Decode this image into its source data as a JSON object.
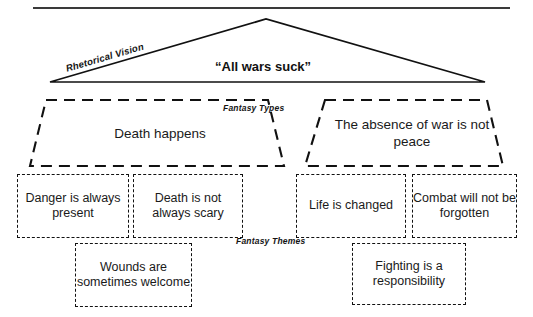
{
  "diagram": {
    "title_rule": "horizontal-rule",
    "rhetorical_vision_label": "Rhetorical Vision",
    "vision_statement": "“All wars suck”",
    "fantasy_types_label": "Fantasy Types",
    "fantasy_themes_label": "Fantasy Themes",
    "fantasy_types": [
      {
        "id": "left",
        "text": "Death happens"
      },
      {
        "id": "right",
        "text": "The absence of war is not peace"
      }
    ],
    "fantasy_themes": [
      {
        "id": "left-1",
        "text": "Danger is always present"
      },
      {
        "id": "left-2",
        "text": "Death is not always scary"
      },
      {
        "id": "left-3",
        "text": "Wounds are sometimes welcome"
      },
      {
        "id": "right-1",
        "text": "Life is changed"
      },
      {
        "id": "right-2",
        "text": "Combat will not be forgotten"
      },
      {
        "id": "right-3",
        "text": "Fighting is a responsibility"
      }
    ],
    "colors": {
      "stroke": "#111111",
      "rule": "#3a3a3a",
      "background": "#ffffff",
      "text": "#1a1a1a"
    }
  }
}
